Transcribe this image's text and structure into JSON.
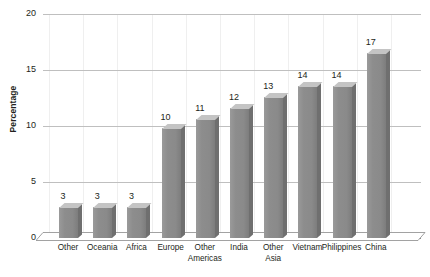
{
  "chart_data": {
    "type": "bar",
    "title": "",
    "subtitle": "",
    "xlabel": "",
    "ylabel": "Percentage",
    "ylim": [
      0,
      20
    ],
    "yticks": [
      0,
      5,
      10,
      15,
      20
    ],
    "ytick_labels": [
      "0",
      "5",
      "10",
      "15",
      "20"
    ],
    "grid": true,
    "grid_axis": "both",
    "legend": "none",
    "style": "3d-bar",
    "bar_color": "#8d8d8d",
    "bar_top_color": "#c4c4c4",
    "bar_side_color": "#6f6f6f",
    "gridline_color": "#bfbfbf",
    "axis_color": "#8a8a8a",
    "text_color": "#231f20",
    "data_labels": true,
    "categories": [
      "Other",
      "Oceania",
      "Africa",
      "Europe",
      "Other Americas",
      "India",
      "Other Asia",
      "Vietnam",
      "Philippines",
      "China"
    ],
    "values": [
      3,
      3,
      3,
      10,
      11,
      12,
      13,
      14,
      14,
      17
    ],
    "bars": [
      {
        "label": "Other",
        "label_line1": "Other",
        "label_line2": "",
        "value": 3,
        "plotted": 2.75
      },
      {
        "label": "Oceania",
        "label_line1": "Oceania",
        "label_line2": "",
        "value": 3,
        "plotted": 2.75
      },
      {
        "label": "Africa",
        "label_line1": "Africa",
        "label_line2": "",
        "value": 3,
        "plotted": 2.8
      },
      {
        "label": "Europe",
        "label_line1": "Europe",
        "label_line2": "",
        "value": 10,
        "plotted": 9.8
      },
      {
        "label": "Other Americas",
        "label_line1": "Other",
        "label_line2": "Americas",
        "value": 11,
        "plotted": 10.6
      },
      {
        "label": "India",
        "label_line1": "India",
        "label_line2": "",
        "value": 12,
        "plotted": 11.6
      },
      {
        "label": "Other Asia",
        "label_line1": "Other",
        "label_line2": "Asia",
        "value": 13,
        "plotted": 12.6
      },
      {
        "label": "Vietnam",
        "label_line1": "Vietnam",
        "label_line2": "",
        "value": 14,
        "plotted": 13.6
      },
      {
        "label": "Philippines",
        "label_line1": "Philippines",
        "label_line2": "",
        "value": 14,
        "plotted": 13.6
      },
      {
        "label": "China",
        "label_line1": "China",
        "label_line2": "",
        "value": 17,
        "plotted": 16.5
      }
    ]
  }
}
